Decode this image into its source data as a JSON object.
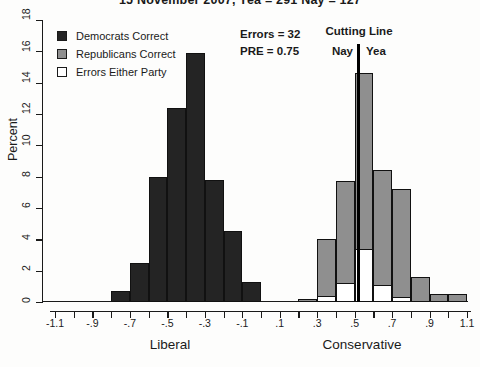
{
  "figure": {
    "title": "15 November 2007, Yea = 291  Nay = 127"
  },
  "legend": {
    "items": [
      {
        "label": "Democrats Correct",
        "color": "#242424",
        "filled": true
      },
      {
        "label": "Republicans Correct",
        "color": "#8f8f8f",
        "filled": true
      },
      {
        "label": "Errors Either Party",
        "color": "#ffffff",
        "filled": false
      }
    ]
  },
  "chart_data": {
    "type": "bar",
    "subtype": "stacked-histogram",
    "title": "15 November 2007, Yea = 291  Nay = 127",
    "ylabel": "Percent",
    "xlabel_left": "Liberal",
    "xlabel_right": "Conservative",
    "xlim": [
      -1.1,
      1.1
    ],
    "ylim": [
      0,
      18
    ],
    "grid": false,
    "legend_position": "top-left",
    "y_ticks": [
      0,
      2,
      4,
      6,
      8,
      10,
      12,
      14,
      16,
      18
    ],
    "x_tick_values": [
      -1.1,
      -0.9,
      -0.7,
      -0.5,
      -0.3,
      -0.1,
      0.1,
      0.3,
      0.5,
      0.7,
      0.9,
      1.1
    ],
    "x_tick_labels": [
      "-1.1",
      "-.9",
      "-.7",
      "-.5",
      "-.3",
      "-.1",
      ".1",
      ".3",
      ".5",
      ".7",
      ".9",
      "1.1"
    ],
    "x_minor_tick_step": 0.1,
    "bin_width": 0.1,
    "cutting_line_x": 0.52,
    "annotations": {
      "errors": "Errors = 32",
      "pre": "PRE = 0.75",
      "cutting_line": "Cutting Line",
      "nay": "Nay",
      "yea": "Yea"
    },
    "colors": {
      "democrat": "#242424",
      "republican": "#8f8f8f",
      "errors": "#ffffff",
      "outline": "#111111"
    },
    "bars": [
      {
        "x0": -0.8,
        "party": "democrat",
        "percent": 0.7,
        "errors_percent": 0
      },
      {
        "x0": -0.7,
        "party": "democrat",
        "percent": 2.5,
        "errors_percent": 0
      },
      {
        "x0": -0.6,
        "party": "democrat",
        "percent": 8.0,
        "errors_percent": 0
      },
      {
        "x0": -0.5,
        "party": "democrat",
        "percent": 12.4,
        "errors_percent": 0
      },
      {
        "x0": -0.4,
        "party": "democrat",
        "percent": 15.9,
        "errors_percent": 0
      },
      {
        "x0": -0.3,
        "party": "democrat",
        "percent": 7.8,
        "errors_percent": 0
      },
      {
        "x0": -0.2,
        "party": "democrat",
        "percent": 4.5,
        "errors_percent": 0
      },
      {
        "x0": -0.1,
        "party": "democrat",
        "percent": 1.3,
        "errors_percent": 0
      },
      {
        "x0": 0.2,
        "party": "republican",
        "percent": 0.2,
        "errors_percent": 0
      },
      {
        "x0": 0.3,
        "party": "republican",
        "percent": 4.0,
        "errors_percent": 0.4
      },
      {
        "x0": 0.4,
        "party": "republican",
        "percent": 7.7,
        "errors_percent": 1.2
      },
      {
        "x0": 0.5,
        "party": "republican",
        "percent": 14.6,
        "errors_percent": 3.4
      },
      {
        "x0": 0.6,
        "party": "republican",
        "percent": 8.4,
        "errors_percent": 1.1
      },
      {
        "x0": 0.7,
        "party": "republican",
        "percent": 7.2,
        "errors_percent": 0.3
      },
      {
        "x0": 0.8,
        "party": "republican",
        "percent": 1.6,
        "errors_percent": 0
      },
      {
        "x0": 0.9,
        "party": "republican",
        "percent": 0.5,
        "errors_percent": 0
      },
      {
        "x0": 1.0,
        "party": "republican",
        "percent": 0.5,
        "errors_percent": 0
      }
    ]
  }
}
